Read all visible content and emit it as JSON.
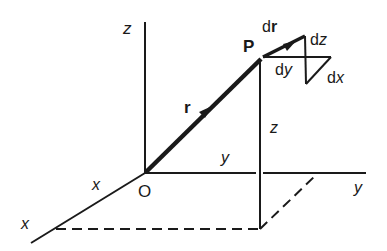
{
  "diagram": {
    "type": "3d-cartesian-position-vector",
    "colors": {
      "ink": "#1a1a1a",
      "background": "#ffffff"
    },
    "axes": {
      "z_label": "z",
      "y_label": "y",
      "x_label": "x"
    },
    "origin_label": "O",
    "point_label": "P",
    "position_vector_label": "r",
    "displacement": {
      "vector_label": "dr",
      "vector_prefix": "d",
      "vector_bold": "r",
      "components": [
        "dx",
        "dy",
        "dz"
      ],
      "dx_label": "dx",
      "dy_label": "dy",
      "dz_label": "dz"
    },
    "coordinate_labels": {
      "x": "x",
      "y": "y",
      "z": "z"
    }
  }
}
